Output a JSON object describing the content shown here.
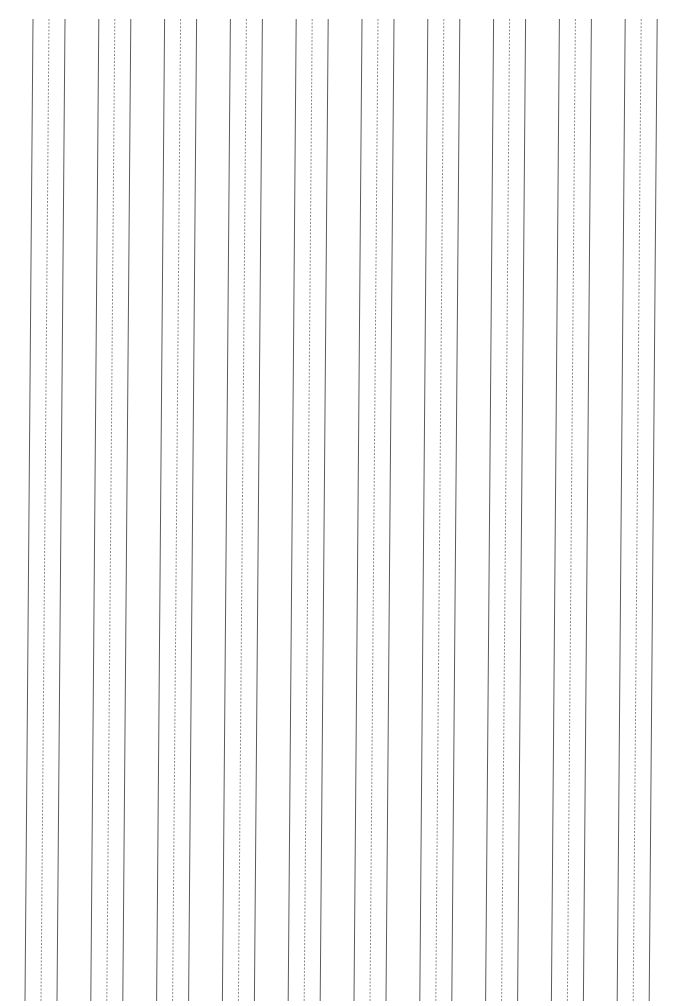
{
  "page": {
    "type": "handwriting practice sheet (vertical guide lines)",
    "width": 684,
    "height": 1006,
    "background": "#ffffff"
  },
  "guides": {
    "top_y": 19,
    "bottom_y": 1001,
    "slant_dx": -8,
    "group_count": 10,
    "group_pitch": 65.8,
    "first_group_x": 33,
    "line_offsets": [
      0,
      16,
      32
    ],
    "line_styles": [
      "solid",
      "dashed",
      "solid"
    ],
    "solid_color": "#5a5a5a",
    "dashed_color": "#8a8a8a",
    "solid_width": 1,
    "dashed_width": 1,
    "dash_pattern": "2 1.5"
  }
}
